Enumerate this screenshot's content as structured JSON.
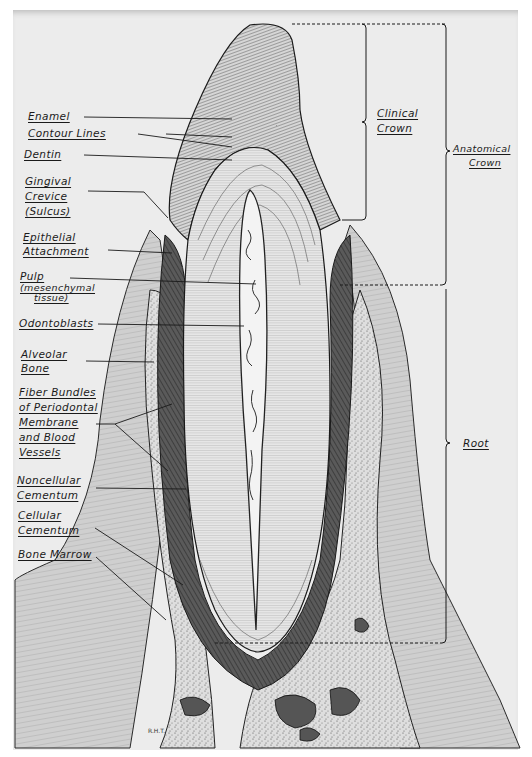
{
  "figure": {
    "type": "anatomical-illustration",
    "signature": "R.H.T."
  },
  "left_labels": [
    {
      "id": "enamel",
      "lines": [
        "Enamel"
      ]
    },
    {
      "id": "contour-lines",
      "lines": [
        "Contour Lines"
      ]
    },
    {
      "id": "dentin",
      "lines": [
        "Dentin"
      ]
    },
    {
      "id": "gingival-crevice",
      "lines": [
        "Gingival",
        "Crevice",
        "(Sulcus)"
      ]
    },
    {
      "id": "epithelial-attachment",
      "lines": [
        "Epithelial",
        "Attachment"
      ]
    },
    {
      "id": "pulp",
      "lines": [
        "Pulp"
      ],
      "sub": [
        "(mesenchymal",
        "tissue)"
      ]
    },
    {
      "id": "odontoblasts",
      "lines": [
        "Odontoblasts"
      ]
    },
    {
      "id": "alveolar-bone",
      "lines": [
        "Alveolar",
        "Bone"
      ]
    },
    {
      "id": "fiber-bundles",
      "lines": [
        "Fiber Bundles",
        "of Periodontal",
        "Membrane",
        "and Blood",
        "Vessels"
      ]
    },
    {
      "id": "noncellular-cementum",
      "lines": [
        "Noncellular",
        "Cementum"
      ]
    },
    {
      "id": "cellular-cementum",
      "lines": [
        "Cellular",
        "Cementum"
      ]
    },
    {
      "id": "bone-marrow",
      "lines": [
        "Bone Marrow"
      ]
    }
  ],
  "right_labels": {
    "clinical_crown": [
      "Clinical",
      "Crown"
    ],
    "anatomical_crown": [
      "Anatomical",
      "Crown"
    ],
    "root": [
      "Root"
    ]
  },
  "colors": {
    "paper": "#ececec",
    "ink": "#1a1a1a",
    "dark_tissue": "#3a3a3a",
    "mid_tissue": "#9a9a9a",
    "light_tissue": "#dcdcdc"
  }
}
